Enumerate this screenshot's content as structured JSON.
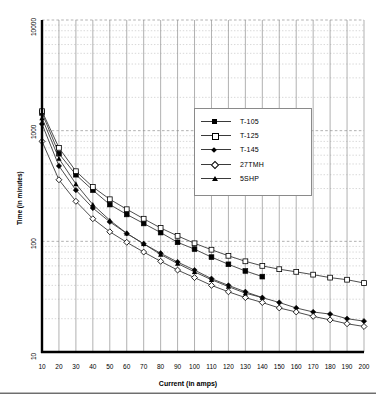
{
  "chart_data": {
    "type": "line",
    "title": "",
    "xlabel": "Current (in amps)",
    "ylabel": "Time (in minutes)",
    "xscale": "linear",
    "yscale": "log",
    "xlim": [
      10,
      200
    ],
    "ylim": [
      10,
      10000
    ],
    "xticks": [
      10,
      20,
      30,
      40,
      50,
      60,
      70,
      80,
      90,
      100,
      110,
      120,
      130,
      140,
      150,
      160,
      170,
      180,
      190,
      200
    ],
    "yticks": [
      10,
      100,
      1000,
      10000
    ],
    "ytick_labels": [
      "10",
      "100",
      "1000",
      "10000"
    ],
    "grid": true,
    "grid_minor": true,
    "legend_position": "upper-right-inside",
    "series": [
      {
        "name": "T-105",
        "marker": "filled-square",
        "x": [
          10,
          20,
          30,
          40,
          50,
          60,
          70,
          80,
          90,
          100,
          110,
          120,
          130,
          140
        ],
        "values": [
          1450,
          620,
          400,
          290,
          215,
          175,
          145,
          120,
          98,
          85,
          72,
          62,
          54,
          48
        ]
      },
      {
        "name": "T-125",
        "marker": "open-square",
        "x": [
          10,
          20,
          30,
          40,
          50,
          60,
          70,
          80,
          90,
          100,
          110,
          120,
          130,
          140,
          150,
          160,
          170,
          180,
          190,
          200
        ],
        "values": [
          1500,
          700,
          430,
          310,
          240,
          195,
          160,
          132,
          112,
          96,
          84,
          74,
          66,
          60,
          56,
          53,
          50,
          47,
          45,
          42
        ]
      },
      {
        "name": "T-145",
        "marker": "filled-diamond",
        "x": [
          10,
          20,
          30,
          40,
          50,
          60,
          70,
          80,
          90,
          100,
          110,
          120,
          130,
          140,
          150,
          160,
          170,
          180,
          190,
          200
        ],
        "values": [
          1150,
          480,
          290,
          200,
          150,
          118,
          95,
          78,
          65,
          55,
          46,
          40,
          35,
          31,
          28,
          25,
          23,
          22,
          20,
          19
        ]
      },
      {
        "name": "27TMH",
        "marker": "open-diamond",
        "x": [
          10,
          20,
          30,
          40,
          50,
          60,
          70,
          80,
          90,
          100,
          110,
          120,
          130,
          140,
          150,
          160,
          170,
          180,
          190,
          200
        ],
        "values": [
          800,
          360,
          230,
          160,
          122,
          98,
          80,
          66,
          55,
          47,
          40,
          35,
          31,
          28,
          25,
          23,
          21,
          19.5,
          18,
          17
        ]
      },
      {
        "name": "5SHP",
        "marker": "filled-triangle",
        "x": [
          10,
          20,
          30,
          40,
          50,
          60,
          70,
          80,
          90,
          100,
          110,
          120,
          130,
          140
        ],
        "values": [
          1300,
          560,
          330,
          215,
          155,
          118,
          95,
          76,
          63,
          53,
          45,
          39,
          34,
          31
        ]
      }
    ]
  },
  "axis": {
    "y_title": "Time (in minutes)",
    "x_title": "Current (in amps)"
  },
  "legend": {
    "items": [
      {
        "label": "T-105",
        "marker": "filled-square"
      },
      {
        "label": "T-125",
        "marker": "open-square"
      },
      {
        "label": "T-145",
        "marker": "filled-diamond"
      },
      {
        "label": "27TMH",
        "marker": "open-diamond"
      },
      {
        "label": "5SHP",
        "marker": "filled-triangle"
      }
    ]
  },
  "colors": {
    "line": "#3a3a3a",
    "axis": "#000000",
    "grid_major": "#8f8f8f",
    "grid_minor": "#bdbdbd",
    "background": "#ffffff"
  }
}
